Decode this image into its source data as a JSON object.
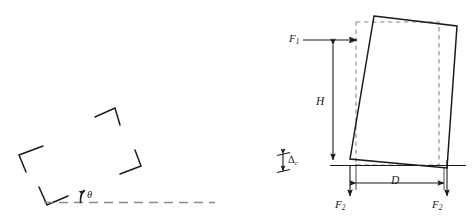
{
  "figure": {
    "type": "mechanics-diagram",
    "background_color": "#ffffff",
    "stroke_color": "#1a1a1a",
    "dashed_color": "#7a7a7a",
    "panels": [
      {
        "name": "left-panel",
        "description": "Scattered corner brackets above a dashed horizontal ground line with an inclination angle theta"
      },
      {
        "name": "right-panel",
        "description": "Tilted solid rectangle overlaid on a dashed upright rectangle, with force arrows F1 at top-left, F2 downward at both bottom corners, height dimension H, base dimension D, and gap Delta"
      }
    ]
  },
  "labels": {
    "force_top": "F",
    "force_top_sub": "1",
    "height": "H",
    "base": "D",
    "force_bottom_left": "F",
    "force_bottom_left_sub": "2",
    "force_bottom_right": "F",
    "force_bottom_right_sub": "2",
    "gap": "Δ",
    "gap_sub": "c",
    "angle": "θ"
  },
  "left_panel_elements": {
    "corner_brackets": [
      {
        "name": "bracket-upper-middle",
        "orientation": "apex-up"
      },
      {
        "name": "bracket-left",
        "orientation": "apex-left"
      },
      {
        "name": "bracket-right",
        "orientation": "apex-right"
      },
      {
        "name": "bracket-bottom",
        "orientation": "apex-down"
      }
    ],
    "ground_line": {
      "name": "dashed-ground-line",
      "style": "dashed"
    },
    "angle_marker": {
      "name": "theta-arc-arrow",
      "style": "curved-arrow"
    }
  },
  "right_panel_elements": {
    "reference_rectangle": {
      "name": "dashed-reference-rectangle",
      "style": "dashed"
    },
    "tilted_rectangle": {
      "name": "solid-tilted-rectangle",
      "style": "solid"
    },
    "ground_line": {
      "name": "solid-ground-line",
      "style": "solid"
    },
    "dimension_lines": [
      {
        "name": "height-dimension-H",
        "orientation": "vertical"
      },
      {
        "name": "base-dimension-D",
        "orientation": "horizontal"
      },
      {
        "name": "gap-dimension-delta",
        "orientation": "vertical"
      }
    ],
    "force_arrows": [
      {
        "name": "force-arrow-F1",
        "direction": "right"
      },
      {
        "name": "force-arrow-F2-left",
        "direction": "down"
      },
      {
        "name": "force-arrow-F2-right",
        "direction": "down"
      }
    ]
  }
}
